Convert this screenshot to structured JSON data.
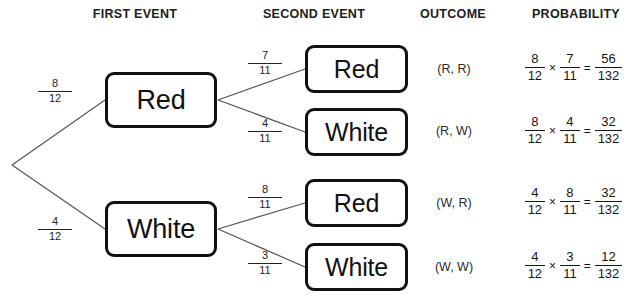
{
  "headers": {
    "first_event": "FIRST EVENT",
    "second_event": "SECOND EVENT",
    "outcome": "OUTCOME",
    "probability": "PROBABILITY"
  },
  "first_event": {
    "nodes": [
      {
        "label": "Red",
        "numerator": "8",
        "denominator": "12"
      },
      {
        "label": "White",
        "numerator": "4",
        "denominator": "12"
      }
    ]
  },
  "second_event": {
    "nodes": [
      {
        "label": "Red",
        "numerator": "7",
        "denominator": "11"
      },
      {
        "label": "White",
        "numerator": "4",
        "denominator": "11"
      },
      {
        "label": "Red",
        "numerator": "8",
        "denominator": "11"
      },
      {
        "label": "White",
        "numerator": "3",
        "denominator": "11"
      }
    ]
  },
  "outcomes": [
    "(R, R)",
    "(R, W)",
    "(W, R)",
    "(W, W)"
  ],
  "probabilities": [
    {
      "first_num": "8",
      "first_den": "12",
      "times": "×",
      "second_num": "7",
      "second_den": "11",
      "equals": "=",
      "result_num": "56",
      "result_den": "132"
    },
    {
      "first_num": "8",
      "first_den": "12",
      "times": "×",
      "second_num": "4",
      "second_den": "11",
      "equals": "=",
      "result_num": "32",
      "result_den": "132"
    },
    {
      "first_num": "4",
      "first_den": "12",
      "times": "×",
      "second_num": "8",
      "second_den": "11",
      "equals": "=",
      "result_num": "32",
      "result_den": "132"
    },
    {
      "first_num": "4",
      "first_den": "12",
      "times": "×",
      "second_num": "3",
      "second_den": "11",
      "equals": "=",
      "result_num": "12",
      "result_den": "132"
    }
  ],
  "colors": {
    "line": "#555555",
    "box_border": "#111111",
    "text": "#1a1a1a",
    "background": "#ffffff"
  }
}
